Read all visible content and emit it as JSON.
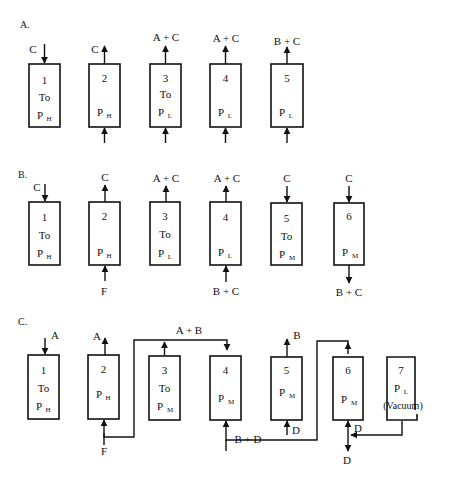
{
  "sections": {
    "A": {
      "label": "A.",
      "units": [
        {
          "num": "1",
          "temp": "To",
          "pressure": "P",
          "psub": "H",
          "top_stream": "C",
          "top_dir": "in"
        },
        {
          "num": "2",
          "temp": "",
          "pressure": "P",
          "psub": "H",
          "top_stream": "C",
          "top_dir": "out",
          "bottom_dir": "in"
        },
        {
          "num": "3",
          "temp": "To",
          "pressure": "P",
          "psub": "L",
          "top_stream": "A + C",
          "top_dir": "out",
          "bottom_dir": "in"
        },
        {
          "num": "4",
          "temp": "",
          "pressure": "P",
          "psub": "L",
          "top_stream": "A + C",
          "top_dir": "out",
          "bottom_dir": "in"
        },
        {
          "num": "5",
          "temp": "",
          "pressure": "P",
          "psub": "L",
          "top_stream": "B + C",
          "top_dir": "out",
          "bottom_dir": "in"
        }
      ]
    },
    "B": {
      "label": "B.",
      "units": [
        {
          "num": "1",
          "temp": "To",
          "pressure": "P",
          "psub": "H",
          "top_stream": "C",
          "top_dir": "in"
        },
        {
          "num": "2",
          "temp": "",
          "pressure": "P",
          "psub": "H",
          "top_stream": "C",
          "top_dir": "out",
          "bottom_stream": "F",
          "bottom_dir": "in"
        },
        {
          "num": "3",
          "temp": "To",
          "pressure": "P",
          "psub": "L",
          "top_stream": "A + C",
          "top_dir": "out"
        },
        {
          "num": "4",
          "temp": "",
          "pressure": "P",
          "psub": "L",
          "top_stream": "A + C",
          "top_dir": "out",
          "bottom_stream": "B + C",
          "bottom_dir": "in"
        },
        {
          "num": "5",
          "temp": "To",
          "pressure": "P",
          "psub": "M",
          "top_stream": "C",
          "top_dir": "in"
        },
        {
          "num": "6",
          "temp": "",
          "pressure": "P",
          "psub": "M",
          "top_stream": "C",
          "top_dir": "in",
          "bottom_stream": "B + C",
          "bottom_dir": "out"
        }
      ]
    },
    "C": {
      "label": "C.",
      "units": [
        {
          "num": "1",
          "temp": "To",
          "pressure": "P",
          "psub": "H",
          "top_stream": "A",
          "top_dir": "in"
        },
        {
          "num": "2",
          "temp": "",
          "pressure": "P",
          "psub": "H",
          "top_stream": "A",
          "top_dir": "out",
          "bottom_stream": "F",
          "bottom_dir": "in"
        },
        {
          "num": "3",
          "temp": "To",
          "pressure": "P",
          "psub": "M"
        },
        {
          "num": "4",
          "temp": "",
          "pressure": "P",
          "psub": "M"
        },
        {
          "num": "5",
          "temp": "",
          "pressure": "P",
          "psub": "M",
          "top_stream": "B",
          "top_dir": "out",
          "bottom_stream": "D",
          "bottom_dir": "in"
        },
        {
          "num": "6",
          "temp": "",
          "pressure": "P",
          "psub": "M",
          "bottom_stream": "D",
          "bottom_dir": "out"
        },
        {
          "num": "7",
          "temp": "",
          "pressure": "P",
          "psub": "L",
          "note": "(Vacuum)"
        }
      ],
      "connections": {
        "top_header": "A + B",
        "bottom_header": "B + D",
        "recycle_label": "D"
      }
    }
  }
}
